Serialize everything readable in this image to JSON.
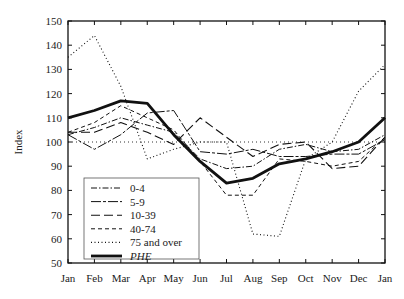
{
  "chart_data": {
    "type": "line",
    "title": "",
    "xlabel": "",
    "ylabel": "Index",
    "ylim": [
      50,
      150
    ],
    "yticks": [
      50,
      60,
      70,
      80,
      90,
      100,
      110,
      120,
      130,
      140,
      150
    ],
    "categories": [
      "Jan",
      "Feb",
      "Mar",
      "Apr",
      "May",
      "Jun",
      "Jul",
      "Aug",
      "Sep",
      "Oct",
      "Nov",
      "Dec",
      "Jan"
    ],
    "reference_line": 100,
    "grid": false,
    "legend_position": "lower-left",
    "series": [
      {
        "name": "0-4",
        "style": "dash-dot",
        "values": [
          103,
          106,
          110,
          107,
          104,
          93,
          89,
          90,
          97,
          99,
          96,
          97,
          103
        ]
      },
      {
        "name": "5-9",
        "style": "long-dash-dot",
        "values": [
          103,
          97,
          103,
          112,
          113,
          96,
          95,
          97,
          94,
          94,
          95,
          95,
          101
        ]
      },
      {
        "name": "10-39",
        "style": "long-dash",
        "values": [
          104,
          104,
          108,
          104,
          99,
          110,
          102,
          94,
          99,
          100,
          89,
          90,
          102
        ]
      },
      {
        "name": "40-74",
        "style": "short-dash",
        "values": [
          104,
          108,
          115,
          110,
          105,
          92,
          78,
          78,
          93,
          92,
          90,
          92,
          102
        ]
      },
      {
        "name": "75 and over",
        "style": "dotted",
        "values": [
          135,
          144,
          123,
          93,
          97,
          100,
          100,
          62,
          61,
          93,
          100,
          121,
          132
        ]
      },
      {
        "name": "PHE",
        "style": "thick-solid",
        "italic": true,
        "values": [
          110,
          113,
          117,
          116,
          103,
          92,
          83,
          85,
          91,
          93,
          96,
          100,
          110
        ]
      }
    ]
  }
}
